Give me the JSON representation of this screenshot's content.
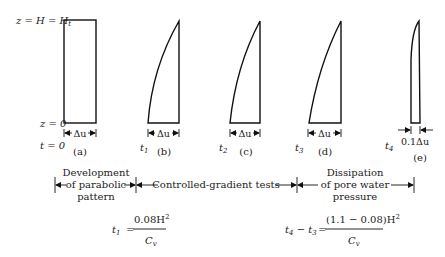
{
  "diagram": {
    "axis_labels": {
      "top": "z = H = H",
      "top_subscript": "t",
      "bottom": "z = 0",
      "time": "t = 0"
    },
    "panels": [
      {
        "id": "a",
        "label": "(a)",
        "time_label": "t = 0",
        "time_sub": "",
        "width_label": "Δu",
        "shape": "rectangle"
      },
      {
        "id": "b",
        "label": "(b)",
        "time_label": "t",
        "time_sub": "1",
        "width_label": "Δu",
        "shape": "parabolic"
      },
      {
        "id": "c",
        "label": "(c)",
        "time_label": "t",
        "time_sub": "2",
        "width_label": "Δu",
        "shape": "parabolic"
      },
      {
        "id": "d",
        "label": "(d)",
        "time_label": "t",
        "time_sub": "3",
        "width_label": "Δu",
        "shape": "parabolic"
      },
      {
        "id": "e",
        "label": "(e)",
        "time_label": "t",
        "time_sub": "4",
        "width_label": "0.1Δu",
        "shape": "thin-parabolic"
      }
    ],
    "phases": [
      {
        "lines": [
          "Development",
          "of parabolic",
          "pattern"
        ]
      },
      {
        "lines": [
          "Controlled-gradient tests"
        ]
      },
      {
        "lines": [
          "Dissipation",
          "of pore water",
          "pressure"
        ]
      }
    ],
    "equations": [
      {
        "lhs": "t",
        "lhs_sub": "1",
        "eq": "=",
        "numerator": "0.08H",
        "num_sup": "2",
        "denominator": "C",
        "den_sub": "v"
      },
      {
        "lhs": "t",
        "lhs_sub": "4",
        "lhs_mid": " − t",
        "lhs_sub2": "3",
        "eq": "=",
        "numerator": "(1.1 − 0.08)H",
        "num_sup": "2",
        "denominator": "C",
        "den_sub": "v"
      }
    ]
  }
}
